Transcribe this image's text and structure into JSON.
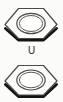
{
  "figure": {
    "background_color": "#fbfbfa",
    "width": 63,
    "height": 102
  },
  "center_label": {
    "text": "U",
    "color": "#2b2b2b"
  },
  "style": {
    "outline_color": "#4a4a4a",
    "shadow_color": "#111111",
    "inner_ring_color": "#4a4a4a",
    "face_fill": "#fdfdfc",
    "outline_width": "1.1",
    "shadow_width": "2.6",
    "inner_ring_width": "1.1"
  },
  "shapes": [
    {
      "name": "hex-nut-top",
      "type": "hexagon",
      "center_x": 31,
      "center_y": 24,
      "radius_x": 27,
      "radius_y": 17,
      "inner_radius_x": 13,
      "inner_radius_y": 9,
      "inner_center_y": 23
    },
    {
      "name": "hex-nut-bottom",
      "type": "hexagon",
      "center_x": 31,
      "center_y": 81,
      "radius_x": 27,
      "radius_y": 16,
      "inner_radius_x": 13,
      "inner_radius_y": 9,
      "inner_center_y": 80
    }
  ]
}
